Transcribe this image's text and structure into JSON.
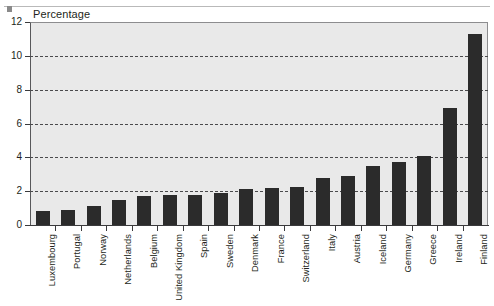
{
  "chart_data": {
    "type": "bar",
    "title": "",
    "ylabel": "Percentage",
    "xlabel": "",
    "ylim": [
      0,
      12
    ],
    "yticks": [
      0,
      2,
      4,
      6,
      8,
      10,
      12
    ],
    "grid": true,
    "legend": false,
    "bar_color": "#2b2b2b",
    "plot_background": "#e9e9e9",
    "categories": [
      "Luxembourg",
      "Portugal",
      "Norway",
      "Netherlands",
      "Belgium",
      "United Kingdom",
      "Spain",
      "Sweden",
      "Denmark",
      "France",
      "Switzerland",
      "Italy",
      "Austria",
      "Iceland",
      "Germany",
      "Greece",
      "Ireland",
      "Finland"
    ],
    "values": [
      0.8,
      0.9,
      1.1,
      1.5,
      1.7,
      1.8,
      1.8,
      1.9,
      2.1,
      2.2,
      2.25,
      2.8,
      2.9,
      3.5,
      3.7,
      4.1,
      6.9,
      11.3
    ]
  },
  "axis": {
    "title": "Percentage",
    "tick_labels": [
      "0",
      "2",
      "4",
      "6",
      "8",
      "10",
      "12"
    ]
  }
}
